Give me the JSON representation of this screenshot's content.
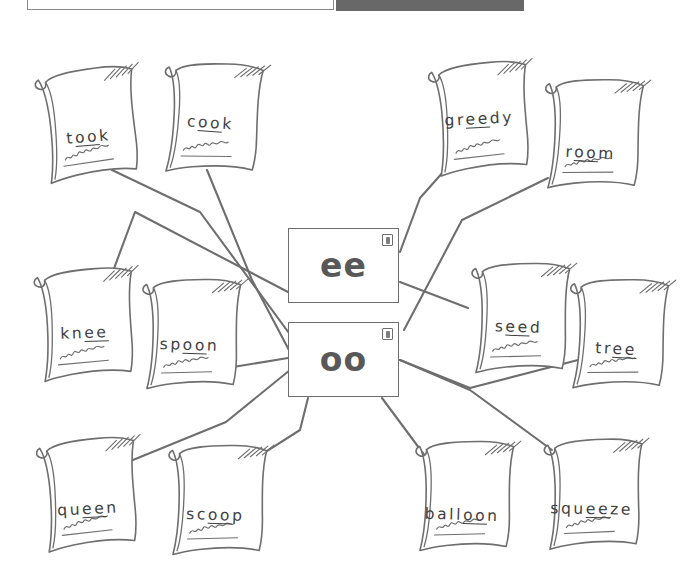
{
  "top_bar": {
    "title_field": {
      "value": "",
      "placeholder": ""
    },
    "tool_chip": {
      "label": ""
    }
  },
  "diagram": {
    "type": "word-sort-mind-map",
    "center_nodes": [
      {
        "id": "ee",
        "label": "ee",
        "icon": "speaker-icon",
        "x": 288,
        "y": 198,
        "w": 111,
        "h": 75
      },
      {
        "id": "oo",
        "label": "oo",
        "icon": "speaker-icon",
        "x": 288,
        "y": 292,
        "w": 111,
        "h": 75
      }
    ],
    "cards": [
      {
        "id": "took",
        "word": "took",
        "pre": "t",
        "vowel": "oo",
        "post": "k",
        "sound": "oo",
        "x": 28,
        "y": 28,
        "rot": -5,
        "text_y": 70
      },
      {
        "id": "cook",
        "word": "cook",
        "pre": "c",
        "vowel": "oo",
        "post": "k",
        "sound": "oo",
        "x": 152,
        "y": 22,
        "rot": 4,
        "text_y": 62
      },
      {
        "id": "greedy",
        "word": "greedy",
        "pre": "gr",
        "vowel": "ee",
        "post": "dy",
        "sound": "ee",
        "x": 420,
        "y": 22,
        "rot": -3,
        "text_y": 58
      },
      {
        "id": "room",
        "word": "room",
        "pre": "r",
        "vowel": "oo",
        "post": "m",
        "sound": "oo",
        "x": 533,
        "y": 38,
        "rot": 3,
        "text_y": 76
      },
      {
        "id": "knee",
        "word": "knee",
        "pre": "kn",
        "vowel": "ee",
        "post": "",
        "sound": "ee",
        "x": 25,
        "y": 228,
        "rot": -2,
        "text_y": 66
      },
      {
        "id": "spoon",
        "word": "spoon",
        "pre": "sp",
        "vowel": "oo",
        "post": "n",
        "sound": "oo",
        "x": 131,
        "y": 238,
        "rot": 2,
        "text_y": 68
      },
      {
        "id": "seed",
        "word": "seed",
        "pre": "s",
        "vowel": "ee",
        "post": "d",
        "sound": "ee",
        "x": 460,
        "y": 222,
        "rot": 2,
        "text_y": 66
      },
      {
        "id": "tree",
        "word": "tree",
        "pre": "tr",
        "vowel": "ee",
        "post": "",
        "sound": "ee",
        "x": 558,
        "y": 238,
        "rot": 3,
        "text_y": 72
      },
      {
        "id": "queen",
        "word": "queen",
        "pre": "qu",
        "vowel": "ee",
        "post": "n",
        "sound": "ee",
        "x": 28,
        "y": 398,
        "rot": -3,
        "text_y": 72
      },
      {
        "id": "scoop",
        "word": "scoop",
        "pre": "sc",
        "vowel": "oo",
        "post": "p",
        "sound": "oo",
        "x": 157,
        "y": 404,
        "rot": 2,
        "text_y": 72
      },
      {
        "id": "balloon",
        "word": "balloon",
        "pre": "ball",
        "vowel": "oo",
        "post": "n",
        "sound": "oo",
        "x": 404,
        "y": 400,
        "rot": 2,
        "text_y": 76
      },
      {
        "id": "squeeze",
        "word": "squeeze",
        "pre": "squ",
        "vowel": "ee",
        "post": "ze",
        "sound": "ee",
        "x": 533,
        "y": 398,
        "rot": 1,
        "text_y": 72
      }
    ],
    "edges": [
      {
        "from": "took",
        "to": "oo",
        "path": "M 112,140 L 200,182 L 300,318"
      },
      {
        "from": "cook",
        "to": "oo",
        "path": "M 207,140 L 252,250 L 290,322"
      },
      {
        "from": "greedy",
        "to": "ee",
        "path": "M 452,132 L 420,168 L 400,222"
      },
      {
        "from": "room",
        "to": "oo",
        "path": "M 548,148 L 462,190 L 404,300"
      },
      {
        "from": "knee",
        "to": "ee",
        "path": "M 103,268 L 135,182 L 288,262"
      },
      {
        "from": "spoon",
        "to": "oo",
        "path": "M 215,340 L 288,328"
      },
      {
        "from": "seed",
        "to": "ee",
        "path": "M 468,278 L 400,252"
      },
      {
        "from": "tree",
        "to": "oo",
        "path": "M 578,330 L 470,358 L 400,330"
      },
      {
        "from": "queen",
        "to": "oo",
        "path": "M 128,432 L 226,392 L 290,340"
      },
      {
        "from": "scoop",
        "to": "oo",
        "path": "M 240,438 L 300,400 L 308,368"
      },
      {
        "from": "balloon",
        "to": "oo",
        "path": "M 428,430 L 382,368"
      },
      {
        "from": "squeeze",
        "to": "ee",
        "path": "M 552,420 L 470,360 L 400,330"
      }
    ]
  },
  "colors": {
    "ink": "#6e6e6e",
    "text": "#3e3e3e",
    "concept_label": "#585858",
    "chip": "#686868",
    "field_border": "#8a8a8a",
    "background": "#ffffff"
  }
}
